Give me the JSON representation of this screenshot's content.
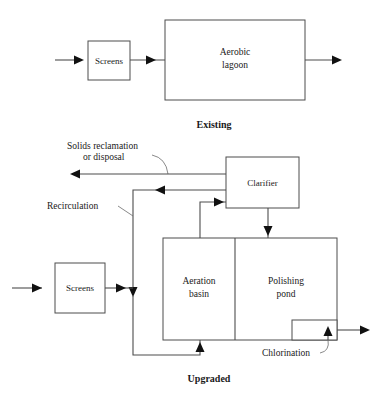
{
  "diagram": {
    "sections": [
      {
        "id": "existing",
        "caption": "Existing",
        "units": [
          {
            "id": "screens-existing",
            "label": "Screens"
          },
          {
            "id": "aerobic-lagoon",
            "label_line1": "Aerobic",
            "label_line2": "lagoon"
          }
        ]
      },
      {
        "id": "upgraded",
        "caption": "Upgraded",
        "units": [
          {
            "id": "clarifier",
            "label": "Clarifier"
          },
          {
            "id": "screens-upgraded",
            "label": "Screens"
          },
          {
            "id": "aeration-basin",
            "label_line1": "Aeration",
            "label_line2": "basin"
          },
          {
            "id": "polishing-pond",
            "label_line1": "Polishing",
            "label_line2": "pond"
          },
          {
            "id": "chlorination",
            "label": "Chlorination"
          }
        ],
        "annotations": [
          {
            "id": "solids",
            "line1": "Solids reclamation",
            "line2": "or disposal"
          },
          {
            "id": "recirculation",
            "label": "Recirculation"
          }
        ]
      }
    ],
    "colors": {
      "background": "#ffffff",
      "box_stroke": "#4d4d4d",
      "flow_line": "#4d4d4d",
      "leader_line": "#6b6b6b",
      "arrow_fill": "#111111",
      "text": "#1a1a1a"
    }
  }
}
